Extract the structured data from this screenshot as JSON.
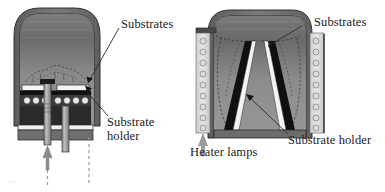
{
  "figure": {
    "type": "technical-cross-section-diagram",
    "panels": [
      {
        "id": "left-panel",
        "name": "pancake-reactor",
        "labels": [
          {
            "key": "substrates",
            "text": "Substrates"
          },
          {
            "key": "substrate_holder_line1",
            "text": "Substrate"
          },
          {
            "key": "substrate_holder_line2",
            "text": "holder"
          }
        ],
        "elements": [
          "chamber-dome",
          "substrate-disc",
          "heater-lamp-row",
          "center-support-tube",
          "gas-inlet-tube",
          "gas-flow-arrow",
          "exhaust-dashed-line"
        ]
      },
      {
        "id": "right-panel",
        "name": "barrel-reactor",
        "labels": [
          {
            "key": "substrates",
            "text": "Substrates"
          },
          {
            "key": "substrate_holder",
            "text": "Substrate holder"
          },
          {
            "key": "heater_lamps",
            "text": "Heater lamps"
          }
        ],
        "elements": [
          "chamber-dome",
          "barrel-susceptor",
          "substrate-strips",
          "lamp-column-left",
          "lamp-column-right",
          "gas-inlet-arrow",
          "gas-flow-dashed-lines"
        ]
      }
    ],
    "colors": {
      "chamber_fill_top": "#6e6e6e",
      "chamber_fill_body": "#8d8d8d",
      "chamber_wall": "#5a5a5a",
      "outline": "#2b2b2b",
      "susceptor_black": "#141414",
      "substrate_white": "#f2f2f2",
      "lamp_fill": "#d8d8d8",
      "background": "#ffffff",
      "label_text": "#1a1a1a"
    }
  }
}
